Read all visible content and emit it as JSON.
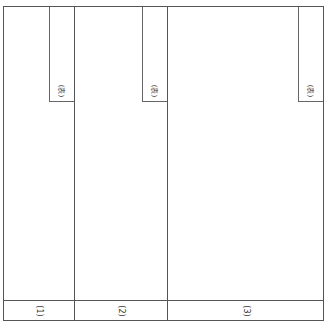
{
  "diagram": {
    "columns": [
      {
        "id": "1",
        "tab_label": "(表)",
        "bottom_label": "(1)"
      },
      {
        "id": "2",
        "tab_label": "(表)",
        "bottom_label": "(2)"
      },
      {
        "id": "3",
        "tab_label": "(表)",
        "bottom_label": "(3)"
      }
    ],
    "colors": {
      "line": "#555555",
      "background": "#ffffff",
      "text": "#333333"
    }
  }
}
